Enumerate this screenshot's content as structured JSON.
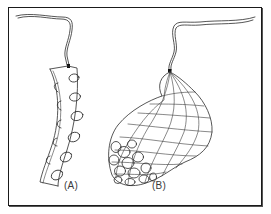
{
  "figure": {
    "frame_color": "#1a1a1a",
    "ink_color": "#2b2b2b",
    "background": "#ffffff",
    "items": [
      {
        "id": "A",
        "label": "(A)",
        "subject": "curved strip with oval holes and side knobs, hung by a cord"
      },
      {
        "id": "B",
        "label": "(B)",
        "subject": "mesh net pouch holding a cluster of round objects, hung by a cord"
      }
    ]
  }
}
